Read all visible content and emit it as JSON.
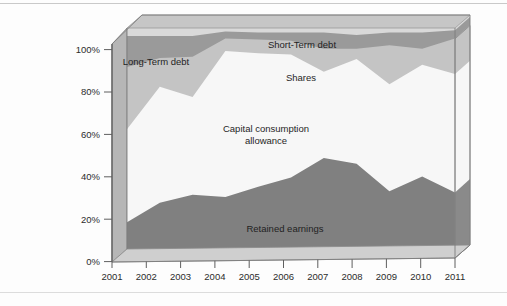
{
  "chart_data": {
    "type": "area",
    "subtype": "stacked-area-3d",
    "title": "",
    "xlabel": "",
    "ylabel": "",
    "ylim": [
      0,
      100
    ],
    "yticks": [
      0,
      20,
      40,
      60,
      80,
      100
    ],
    "ytick_labels": [
      "0%",
      "20%",
      "40%",
      "60%",
      "80%",
      "100%"
    ],
    "grid": false,
    "legend_position": "inline-annotations",
    "stacked_total": 100,
    "categories": [
      2001,
      2002,
      2003,
      2004,
      2005,
      2006,
      2007,
      2008,
      2009,
      2010,
      2011
    ],
    "xtick_labels": [
      "2001",
      "2002",
      "2003",
      "2004",
      "2005",
      "2006",
      "2007",
      "2008",
      "2009",
      "2010",
      "2011"
    ],
    "series": [
      {
        "name": "Retained earnings",
        "color": "#808080",
        "values": [
          15.5,
          24.0,
          27.5,
          26.5,
          31.0,
          35.0,
          43.5,
          41.0,
          29.0,
          35.5,
          28.5
        ]
      },
      {
        "name": "Capital consumption allowance",
        "color": "#f7f7f7",
        "values": [
          40.5,
          50.5,
          42.5,
          63.5,
          58.0,
          53.5,
          37.5,
          45.5,
          46.5,
          48.5,
          51.5
        ]
      },
      {
        "name": "Shares",
        "color": "#c4c4c4",
        "values": [
          27.0,
          12.5,
          17.5,
          5.5,
          6.0,
          6.0,
          10.0,
          4.5,
          17.0,
          7.0,
          15.5
        ]
      },
      {
        "name": "Long-Term debt",
        "color": "#9a9a9a",
        "values": [
          13.5,
          9.5,
          9.0,
          3.0,
          3.0,
          3.5,
          7.0,
          6.0,
          5.5,
          7.0,
          3.5
        ]
      },
      {
        "name": "Short-Term debt",
        "color": "#d9d9d9",
        "values": [
          3.5,
          3.5,
          3.5,
          1.5,
          2.0,
          2.0,
          2.0,
          3.0,
          2.0,
          2.0,
          1.0
        ]
      }
    ],
    "annotations": [
      {
        "text": "Short-Term debt",
        "series": "Short-Term debt"
      },
      {
        "text": "Long-Term debt",
        "series": "Long-Term debt"
      },
      {
        "text": "Shares",
        "series": "Shares"
      },
      {
        "text": "Capital consumption",
        "series": "Capital consumption allowance"
      },
      {
        "text": "allowance",
        "series": "Capital consumption allowance"
      },
      {
        "text": "Retained earnings",
        "series": "Retained earnings"
      }
    ]
  },
  "axis": {
    "y": {
      "t0": "0%",
      "t1": "20%",
      "t2": "40%",
      "t3": "60%",
      "t4": "80%",
      "t5": "100%"
    },
    "x": {
      "t0": "2001",
      "t1": "2002",
      "t2": "2003",
      "t3": "2004",
      "t4": "2005",
      "t5": "2006",
      "t6": "2007",
      "t7": "2008",
      "t8": "2009",
      "t9": "2010",
      "t10": "2011"
    }
  },
  "labels": {
    "short_term_debt": "Short-Term debt",
    "long_term_debt": "Long-Term debt",
    "shares": "Shares",
    "capital_consumption_line1": "Capital consumption",
    "capital_consumption_line2": "allowance",
    "retained_earnings": "Retained earnings"
  },
  "colors": {
    "retained_earnings": "#808080",
    "capital_consumption": "#f7f7f7",
    "shares": "#c4c4c4",
    "long_term_debt": "#9a9a9a",
    "short_term_debt": "#d9d9d9",
    "wall_left": "#b4b4b4",
    "wall_right": "#a8a8a8",
    "wall_top": "#c0c0c0",
    "floor": "#d2d2d2",
    "axis_line": "#6e6e6e",
    "card_background": "#fdfdfd",
    "rule": "#c9c9c9"
  }
}
